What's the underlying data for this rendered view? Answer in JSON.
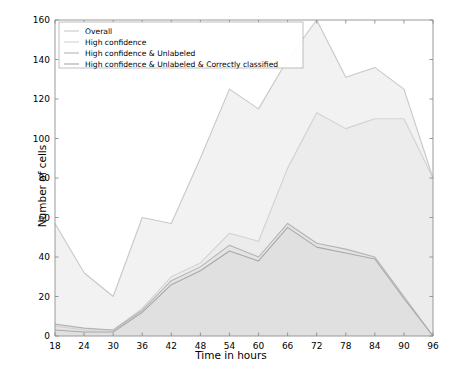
{
  "chart_data": {
    "type": "area",
    "title": "",
    "xlabel": "Time in hours",
    "ylabel": "Number of cells",
    "x": [
      18,
      24,
      30,
      36,
      42,
      48,
      54,
      60,
      66,
      72,
      78,
      84,
      90,
      96
    ],
    "xticks": [
      18,
      24,
      30,
      36,
      42,
      48,
      54,
      60,
      66,
      72,
      78,
      84,
      90,
      96
    ],
    "yticks": [
      0,
      20,
      40,
      60,
      80,
      100,
      120,
      140,
      160
    ],
    "xlim": [
      18,
      96
    ],
    "ylim": [
      0,
      160
    ],
    "grid": false,
    "legend_position": "upper left",
    "series": [
      {
        "name": "Overall",
        "color": "#c8c8c8",
        "fill": "#f2f2f2",
        "values": [
          57,
          32,
          20,
          60,
          57,
          90,
          125,
          115,
          140,
          160,
          131,
          136,
          125,
          80
        ]
      },
      {
        "name": "High confidence",
        "color": "#d2d2d2",
        "fill": "#ececec",
        "values": [
          5,
          3,
          3,
          14,
          30,
          37,
          52,
          48,
          85,
          113,
          105,
          110,
          110,
          80
        ]
      },
      {
        "name": "High confidence & Unlabeled",
        "color": "#b4b4b4",
        "fill": "#e4e4e4",
        "values": [
          6,
          4,
          3,
          13,
          28,
          35,
          46,
          40,
          57,
          47,
          44,
          40,
          20,
          0
        ]
      },
      {
        "name": "High confidence & Unlabeled & Correctly classified",
        "color": "#a8a8a8",
        "fill": "#e0e0e0",
        "values": [
          3,
          2,
          2,
          12,
          26,
          33,
          43,
          38,
          55,
          45,
          42,
          39,
          19,
          0
        ]
      }
    ]
  },
  "axes": {
    "xlabel": "Time in hours",
    "ylabel": "Number of cells"
  },
  "legend": {
    "items": [
      {
        "label": "Overall"
      },
      {
        "label": "High confidence"
      },
      {
        "label": "High confidence & Unlabeled"
      },
      {
        "label": "High confidence & Unlabeled & Correctly classified"
      }
    ]
  }
}
